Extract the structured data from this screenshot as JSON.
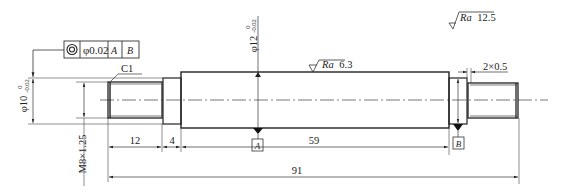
{
  "drawing": {
    "title": "Shaft part drawing",
    "geometric_tolerance": {
      "symbol": "concentricity",
      "value": "φ0.02",
      "datum_1": "A",
      "datum_2": "B"
    },
    "chamfer": "C1",
    "diameters": {
      "main": {
        "nominal": "φ12",
        "upper": "0",
        "lower": "-0.02"
      },
      "left_neck": {
        "nominal": "φ10",
        "upper": "0",
        "lower": "-0.02"
      }
    },
    "thread": "M8×1.25",
    "undercut": "2×0.5",
    "roughness": {
      "general": {
        "prefix": "Ra",
        "value": "12.5"
      },
      "main_surface": {
        "prefix": "Ra",
        "value": "6.3"
      }
    },
    "datums": [
      "A",
      "B"
    ],
    "dimensions": {
      "thread_length": "12",
      "neck_length": "4",
      "main_length": "59",
      "total_length": "91"
    }
  }
}
